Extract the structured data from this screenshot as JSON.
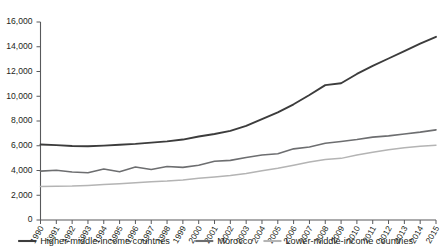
{
  "chart_data": {
    "type": "line",
    "title": "",
    "subtitle": "",
    "xlabel": "",
    "ylabel": "",
    "grid": false,
    "legend_position": "bottom",
    "x": [
      1990,
      1991,
      1992,
      1993,
      1994,
      1995,
      1996,
      1997,
      1998,
      1999,
      2000,
      2001,
      2002,
      2003,
      2004,
      2005,
      2006,
      2007,
      2008,
      2009,
      2010,
      2011,
      2012,
      2013,
      2014,
      2015
    ],
    "categories": [
      "1990",
      "1991",
      "1992",
      "1993",
      "1994",
      "1995",
      "1996",
      "1997",
      "1998",
      "1999",
      "2000",
      "2001",
      "2002",
      "2003",
      "2004",
      "2005",
      "2006",
      "2007",
      "2008",
      "2009",
      "2010",
      "2011",
      "2012",
      "2013",
      "2014",
      "2015"
    ],
    "xlim": [
      1990,
      2015
    ],
    "ylim": [
      0,
      16000
    ],
    "ytick_values": [
      0,
      2000,
      4000,
      6000,
      8000,
      10000,
      12000,
      14000,
      16000
    ],
    "ytick_labels": [
      "0",
      "2,000",
      "4,000",
      "6,000",
      "8,000",
      "10,000",
      "12,000",
      "14,000",
      "16,000"
    ],
    "series": [
      {
        "name": "Higher-middle-income countries",
        "color": "#3c3c3c",
        "values": [
          6100,
          6050,
          5980,
          5960,
          6010,
          6080,
          6150,
          6250,
          6350,
          6500,
          6750,
          6950,
          7200,
          7600,
          8150,
          8700,
          9350,
          10100,
          10900,
          11050,
          11800,
          12450,
          13050,
          13650,
          14250,
          14800
        ]
      },
      {
        "name": "Morocco",
        "color": "#6d6e70",
        "values": [
          3950,
          4020,
          3880,
          3820,
          4120,
          3900,
          4280,
          4080,
          4320,
          4250,
          4420,
          4750,
          4820,
          5050,
          5250,
          5350,
          5750,
          5900,
          6200,
          6350,
          6500,
          6700,
          6800,
          6950,
          7100,
          7280
        ]
      },
      {
        "name": "Lower-middle-income countries",
        "color": "#b4b4b4",
        "values": [
          2700,
          2720,
          2740,
          2790,
          2860,
          2930,
          3020,
          3100,
          3150,
          3230,
          3380,
          3480,
          3600,
          3760,
          3980,
          4180,
          4420,
          4680,
          4880,
          4980,
          5250,
          5480,
          5680,
          5830,
          5950,
          6050
        ]
      }
    ]
  },
  "legend": {
    "items": [
      {
        "label": "Higher-middle-income countries",
        "color": "#3c3c3c"
      },
      {
        "label": "Morocco",
        "color": "#6d6e70"
      },
      {
        "label": "Lower-middle-income countries",
        "color": "#b4b4b4"
      }
    ]
  }
}
